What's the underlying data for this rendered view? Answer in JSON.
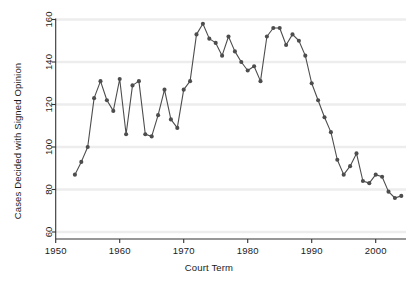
{
  "chart_data": {
    "type": "line",
    "title": "",
    "xlabel": "Court Term",
    "ylabel": "Cases Decided with Signed Opinion",
    "xlim": [
      1950,
      2005.5
    ],
    "ylim": [
      57,
      163
    ],
    "xticks": [
      1950,
      1960,
      1970,
      1980,
      1990,
      2000
    ],
    "xtick_labels": [
      "1950",
      "1960",
      "1970",
      "1980",
      "1990",
      "2000"
    ],
    "yticks": [
      60,
      80,
      100,
      120,
      140,
      160
    ],
    "ytick_labels": [
      "60",
      "80",
      "100",
      "120",
      "140",
      "160"
    ],
    "grid": "horizontal",
    "legend": "none",
    "marker": "circle",
    "series_color": "#4d4d4d",
    "grid_color": "#ededed",
    "axis_color": "#333333",
    "background": "#ffffff",
    "x": [
      1953,
      1954,
      1955,
      1956,
      1957,
      1958,
      1959,
      1960,
      1961,
      1962,
      1963,
      1964,
      1965,
      1966,
      1967,
      1968,
      1969,
      1970,
      1971,
      1972,
      1973,
      1974,
      1975,
      1976,
      1977,
      1978,
      1979,
      1980,
      1981,
      1982,
      1983,
      1984,
      1985,
      1986,
      1987,
      1988,
      1989,
      1990,
      1991,
      1992,
      1993,
      1994,
      1995,
      1996,
      1997,
      1998,
      1999,
      2000,
      2001,
      2002,
      2003,
      2004
    ],
    "values": [
      87,
      93,
      100,
      123,
      131,
      122,
      117,
      132,
      106,
      129,
      131,
      106,
      105,
      115,
      127,
      113,
      109,
      127,
      131,
      153,
      158,
      151,
      149,
      143,
      152,
      145,
      140,
      136,
      138,
      131,
      152,
      156,
      156,
      148,
      153,
      150,
      143,
      130,
      122,
      114,
      107,
      94,
      87,
      91,
      97,
      84,
      83,
      87,
      86,
      79,
      76,
      77
    ]
  },
  "geometry": {
    "plot_left": 55.7,
    "plot_right": 404,
    "plot_top": 19.5,
    "plot_bottom": 239,
    "x_origin_year": 1950,
    "px_per_year": 6.4,
    "y_value_at_bottom_tick": 60,
    "y_px_per_unit": 2.125,
    "y_px_at_60": 232
  }
}
